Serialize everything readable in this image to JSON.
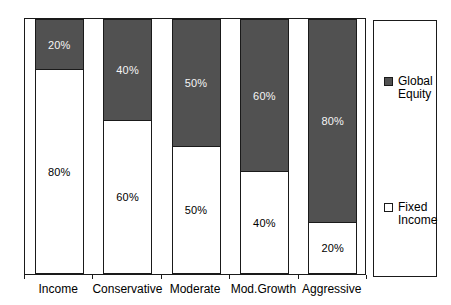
{
  "chart_data": {
    "type": "bar",
    "stacked": true,
    "orientation": "vertical",
    "categories": [
      "Income",
      "Conservative",
      "Moderate",
      "Mod.Growth",
      "Aggressive"
    ],
    "series": [
      {
        "name": "Global Equity",
        "stack_position": "top",
        "values": [
          20,
          40,
          50,
          60,
          80
        ],
        "data_labels": [
          "20%",
          "40%",
          "50%",
          "60%",
          "80%"
        ],
        "fill": "#515151"
      },
      {
        "name": "Fixed Income",
        "stack_position": "bottom",
        "values": [
          80,
          60,
          50,
          40,
          20
        ],
        "data_labels": [
          "80%",
          "60%",
          "50%",
          "40%",
          "20%"
        ],
        "fill": "#ffffff"
      }
    ],
    "ylim": [
      0,
      100
    ],
    "grid": false,
    "legend_position": "right",
    "title": "",
    "xlabel": "",
    "ylabel": ""
  },
  "legend": {
    "entries": [
      {
        "label": "Global Equity",
        "filled": true
      },
      {
        "label": "Fixed Income",
        "filled": false
      }
    ]
  },
  "colors": {
    "global_equity_fill": "#515151",
    "fixed_income_fill": "#ffffff",
    "line": "#1a1a1a",
    "label_on_dark": "#f5f5f5",
    "label_on_light": "#000000",
    "background": "#ffffff"
  }
}
